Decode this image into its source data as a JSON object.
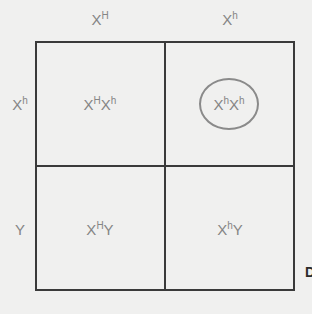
{
  "diagram": {
    "type": "punnett-square",
    "column_headers": [
      {
        "base": "X",
        "sup": "H"
      },
      {
        "base": "X",
        "sup": "h"
      }
    ],
    "row_headers": [
      {
        "base": "X",
        "sup": "h",
        "suffix": ""
      },
      {
        "base": "Y",
        "sup": "",
        "suffix": ""
      }
    ],
    "cells": [
      [
        {
          "a": "X",
          "a_sup": "H",
          "b": "X",
          "b_sup": "h",
          "circled": false
        },
        {
          "a": "X",
          "a_sup": "h",
          "b": "X",
          "b_sup": "h",
          "circled": true
        }
      ],
      [
        {
          "a": "X",
          "a_sup": "H",
          "b": "Y",
          "b_sup": "",
          "circled": false
        },
        {
          "a": "X",
          "a_sup": "h",
          "b": "Y",
          "b_sup": "",
          "circled": false
        }
      ]
    ],
    "edge_letter": "D",
    "colors": {
      "background": "#f0f0ef",
      "grid_line": "#3a3a3a",
      "text": "#858585",
      "circle": "#8a8a8a"
    }
  }
}
